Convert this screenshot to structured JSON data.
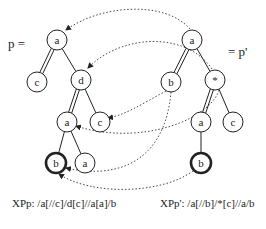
{
  "diagram": {
    "left_tree": {
      "label": "p =",
      "xpath": "XPp: /a[//c]/d[c]//a[a]/b",
      "nodes": [
        {
          "id": "L1",
          "label": "a",
          "x": 57,
          "y": 40,
          "bold": false
        },
        {
          "id": "L2",
          "label": "c",
          "x": 37,
          "y": 82,
          "bold": false
        },
        {
          "id": "L3",
          "label": "d",
          "x": 81,
          "y": 80,
          "bold": false
        },
        {
          "id": "L4",
          "label": "a",
          "x": 67,
          "y": 122,
          "bold": false
        },
        {
          "id": "L5",
          "label": "c",
          "x": 100,
          "y": 122,
          "bold": false
        },
        {
          "id": "L6",
          "label": "b",
          "x": 56,
          "y": 163,
          "bold": true
        },
        {
          "id": "L7",
          "label": "a",
          "x": 85,
          "y": 163,
          "bold": false
        }
      ],
      "edges": [
        {
          "from": "L1",
          "to": "L2",
          "type": "descendant"
        },
        {
          "from": "L1",
          "to": "L3",
          "type": "child"
        },
        {
          "from": "L3",
          "to": "L4",
          "type": "descendant"
        },
        {
          "from": "L3",
          "to": "L5",
          "type": "child"
        },
        {
          "from": "L4",
          "to": "L6",
          "type": "child"
        },
        {
          "from": "L4",
          "to": "L7",
          "type": "child"
        }
      ]
    },
    "right_tree": {
      "label": "= p'",
      "xpath": "XPp': /a[//b]/*[c]//a/b",
      "nodes": [
        {
          "id": "R1",
          "label": "a",
          "x": 192,
          "y": 40,
          "bold": false
        },
        {
          "id": "R2",
          "label": "b",
          "x": 171,
          "y": 82,
          "bold": false
        },
        {
          "id": "R3",
          "label": "*",
          "x": 215,
          "y": 80,
          "bold": false
        },
        {
          "id": "R4",
          "label": "a",
          "x": 201,
          "y": 122,
          "bold": false
        },
        {
          "id": "R5",
          "label": "c",
          "x": 233,
          "y": 122,
          "bold": false
        },
        {
          "id": "R6",
          "label": "b",
          "x": 201,
          "y": 163,
          "bold": true
        }
      ],
      "edges": [
        {
          "from": "R1",
          "to": "R2",
          "type": "descendant"
        },
        {
          "from": "R1",
          "to": "R3",
          "type": "child"
        },
        {
          "from": "R3",
          "to": "R4",
          "type": "descendant"
        },
        {
          "from": "R3",
          "to": "R5",
          "type": "child"
        },
        {
          "from": "R4",
          "to": "R6",
          "type": "child"
        }
      ]
    },
    "mappings": [
      {
        "from": "R1",
        "to": "L1"
      },
      {
        "from": "R2",
        "to": "L6"
      },
      {
        "from": "R3",
        "to": "L3"
      },
      {
        "from": "R4",
        "to": "L4"
      },
      {
        "from": "R5",
        "to": "L5"
      },
      {
        "from": "R6",
        "to": "L6"
      }
    ]
  }
}
